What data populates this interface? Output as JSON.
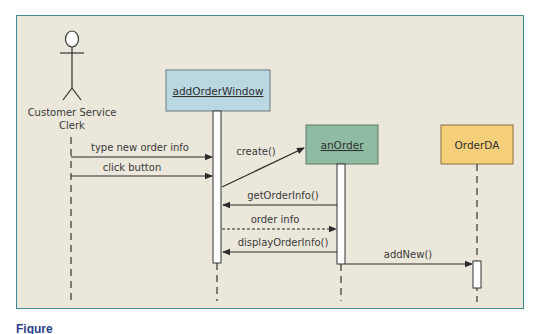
{
  "diagram": {
    "type": "UML sequence diagram",
    "frame": {
      "background": "#ebe7da",
      "border_color": "#3f8a8e"
    },
    "actor": {
      "name": "Customer Service Clerk",
      "line1": "Customer Service",
      "line2": "Clerk"
    },
    "objects": [
      {
        "id": "addOrderWindow",
        "label": "addOrderWindow",
        "underlined": true,
        "fill": "#b9d8e2"
      },
      {
        "id": "anOrder",
        "label": "anOrder",
        "underlined": true,
        "fill": "#8fbba3"
      },
      {
        "id": "OrderDA",
        "label": "OrderDA",
        "underlined": false,
        "fill": "#f6cf7a"
      }
    ],
    "messages": [
      {
        "label": "type new order info",
        "from": "Customer Service Clerk",
        "to": "addOrderWindow",
        "style": "solid"
      },
      {
        "label": "click button",
        "from": "Customer Service Clerk",
        "to": "addOrderWindow",
        "style": "solid"
      },
      {
        "label": "create()",
        "from": "addOrderWindow",
        "to": "anOrder",
        "style": "solid"
      },
      {
        "label": "getOrderInfo()",
        "from": "anOrder",
        "to": "addOrderWindow",
        "style": "solid"
      },
      {
        "label": "order info",
        "from": "addOrderWindow",
        "to": "anOrder",
        "style": "dashed"
      },
      {
        "label": "displayOrderInfo()",
        "from": "anOrder",
        "to": "addOrderWindow",
        "style": "solid"
      },
      {
        "label": "addNew()",
        "from": "anOrder",
        "to": "OrderDA",
        "style": "solid"
      }
    ]
  },
  "caption": {
    "text": "Figure"
  }
}
